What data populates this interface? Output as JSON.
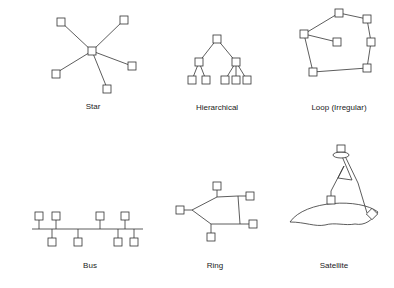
{
  "colors": {
    "stroke": "#333333",
    "background": "#ffffff"
  },
  "diagrams": [
    {
      "id": "star",
      "label": "Star"
    },
    {
      "id": "hierarchical",
      "label": "Hierarchical"
    },
    {
      "id": "loop",
      "label": "Loop (Irregular)"
    },
    {
      "id": "bus",
      "label": "Bus"
    },
    {
      "id": "ring",
      "label": "Ring"
    },
    {
      "id": "satellite",
      "label": "Satellite"
    }
  ]
}
